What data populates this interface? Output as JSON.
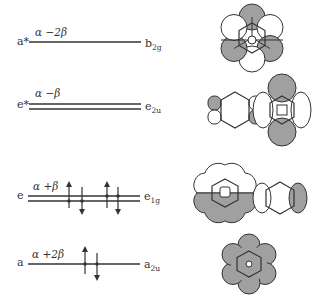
{
  "diagram": {
    "type": "molecular-orbital-energy-diagram",
    "levels": [
      {
        "left_label": "a*",
        "energy": "α −2β",
        "right_label": "b",
        "right_sub": "2g",
        "degenerate": false,
        "electrons": 0
      },
      {
        "left_label": "e*",
        "energy": "α −β",
        "right_label": "e",
        "right_sub": "2u",
        "degenerate": true,
        "electrons": 0
      },
      {
        "left_label": "e",
        "energy": "α +β",
        "right_label": "e",
        "right_sub": "1g",
        "degenerate": true,
        "electrons": 4
      },
      {
        "left_label": "a",
        "energy": "α +2β",
        "right_label": "a",
        "right_sub": "2u",
        "degenerate": false,
        "electrons": 2
      }
    ],
    "colors": {
      "line": "#333333",
      "lobe_shaded": "#a0a0a0",
      "lobe_light": "#ffffff"
    }
  }
}
